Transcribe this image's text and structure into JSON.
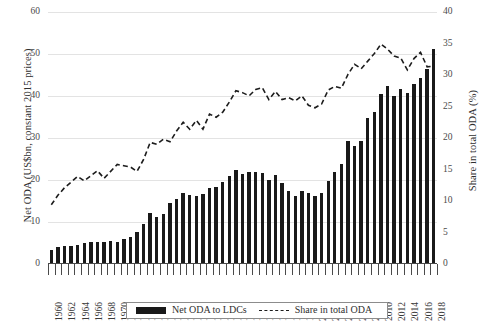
{
  "chart_data": {
    "type": "bar",
    "title": "",
    "subtitle": "",
    "xlabel": "",
    "ylabel": "Net ODA (US$bn, constant 2015 prices)",
    "y2label": "Share in total ODA (%)",
    "ylim": [
      0,
      60
    ],
    "y2lim": [
      0,
      40
    ],
    "yticks": [
      0,
      10,
      20,
      30,
      40,
      50,
      60
    ],
    "y2ticks": [
      0,
      5,
      10,
      15,
      20,
      25,
      30,
      35,
      40
    ],
    "grid": true,
    "legend_position": "bottom",
    "categories": [
      1960,
      1961,
      1962,
      1963,
      1964,
      1965,
      1966,
      1967,
      1968,
      1969,
      1970,
      1971,
      1972,
      1973,
      1974,
      1975,
      1976,
      1977,
      1978,
      1979,
      1980,
      1981,
      1982,
      1983,
      1984,
      1985,
      1986,
      1987,
      1988,
      1989,
      1990,
      1991,
      1992,
      1993,
      1994,
      1995,
      1996,
      1997,
      1998,
      1999,
      2000,
      2001,
      2002,
      2003,
      2004,
      2005,
      2006,
      2007,
      2008,
      2009,
      2010,
      2011,
      2012,
      2013,
      2014,
      2015,
      2016,
      2017,
      2018
    ],
    "tick_labels": [
      "1960",
      "1962",
      "1964",
      "1966",
      "1968",
      "1970",
      "1972",
      "1974",
      "1976",
      "1978",
      "1980",
      "1982",
      "1984",
      "1986",
      "1988",
      "1990",
      "1992",
      "1994",
      "1996",
      "1998",
      "2000",
      "2002",
      "2004",
      "2006",
      "2008",
      "2010",
      "2012",
      "2014",
      "2016",
      "2018"
    ],
    "series": [
      {
        "name": "Net ODA to LDCs",
        "type": "bar",
        "axis": "left",
        "unit": "US$bn, constant 2015 prices",
        "color": "#191919",
        "values": [
          3.4,
          4.0,
          4.2,
          4.4,
          4.6,
          5.0,
          5.2,
          5.3,
          5.2,
          5.5,
          5.3,
          6.0,
          6.5,
          7.6,
          9.6,
          12.2,
          11.3,
          12.0,
          14.6,
          15.4,
          16.9,
          16.4,
          16.3,
          16.6,
          18.0,
          18.3,
          19.6,
          21.0,
          22.3,
          21.5,
          22.0,
          21.8,
          21.7,
          19.9,
          21.2,
          19.3,
          17.3,
          16.3,
          17.5,
          16.9,
          16.3,
          17.0,
          19.7,
          22.0,
          23.9,
          29.3,
          28.0,
          29.2,
          34.7,
          36.1,
          40.5,
          42.3,
          40.0,
          41.6,
          40.6,
          42.8,
          44.4,
          46.4,
          51.2
        ]
      },
      {
        "name": "Share in total ODA",
        "type": "line",
        "style": "dashed",
        "axis": "right",
        "unit": "%",
        "color": "#1c1c1c",
        "values": [
          9.4,
          10.9,
          12.1,
          13.0,
          13.9,
          13.2,
          14.0,
          14.8,
          13.6,
          14.7,
          15.8,
          15.6,
          15.4,
          14.7,
          16.6,
          19.3,
          19.0,
          19.8,
          19.4,
          21.1,
          22.5,
          21.4,
          22.8,
          21.4,
          23.8,
          23.3,
          24.1,
          25.7,
          27.5,
          27.2,
          26.7,
          27.7,
          28.0,
          26.1,
          27.4,
          26.1,
          26.4,
          25.9,
          26.7,
          25.2,
          24.8,
          25.4,
          27.6,
          28.2,
          27.9,
          30.1,
          31.7,
          31.0,
          32.2,
          33.4,
          34.9,
          34.1,
          33.0,
          32.7,
          30.8,
          32.6,
          33.6,
          31.3,
          31.4
        ]
      }
    ],
    "legend": [
      {
        "label": "Net ODA to LDCs",
        "marker": "bar",
        "color": "#191919"
      },
      {
        "label": "Share in total ODA",
        "marker": "dashed-line",
        "color": "#1c1c1c"
      }
    ]
  },
  "colors": {
    "bar": "#191919",
    "line": "#1c1c1c",
    "grid": "#e3e3e3",
    "axis": "#4a4a4a",
    "text": "#2f2f2f",
    "background": "#ffffff"
  }
}
